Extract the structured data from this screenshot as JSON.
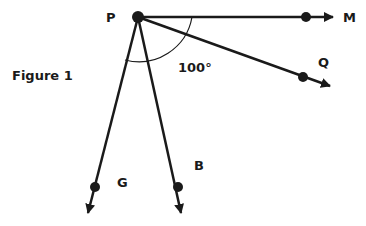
{
  "figure": {
    "caption": "Figure 1",
    "vertex": {
      "label": "P"
    },
    "rays": [
      {
        "label": "M"
      },
      {
        "label": "Q"
      },
      {
        "label": "G"
      },
      {
        "label": "B"
      }
    ],
    "angle": {
      "label": "100°",
      "between": [
        "M",
        "G"
      ]
    },
    "colors": {
      "line": "#1a1a1a",
      "background": "#ffffff"
    }
  }
}
